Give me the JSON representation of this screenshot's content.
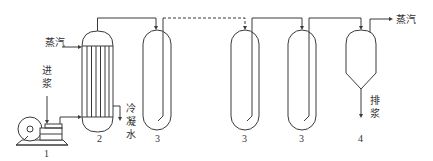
{
  "diagram": {
    "type": "process-flow",
    "colors": {
      "line": "#3a3a3a",
      "text": "#333333",
      "background": "#ffffff"
    },
    "labels": {
      "steam_in": "蒸汽",
      "feed_in_1": "进",
      "feed_in_2": "浆",
      "condensate_1": "冷",
      "condensate_2": "凝",
      "condensate_3": "水",
      "steam_out": "蒸汽",
      "discharge_1": "排",
      "discharge_2": "浆"
    },
    "equipment": [
      {
        "id": "1",
        "name": "pump",
        "label": "1"
      },
      {
        "id": "2",
        "name": "heater",
        "label": "2"
      },
      {
        "id": "3a",
        "name": "holding-tube-1",
        "label": "3"
      },
      {
        "id": "3b",
        "name": "holding-tube-2",
        "label": "3"
      },
      {
        "id": "3c",
        "name": "holding-tube-3",
        "label": "3"
      },
      {
        "id": "4",
        "name": "flash-tank",
        "label": "4"
      }
    ]
  }
}
